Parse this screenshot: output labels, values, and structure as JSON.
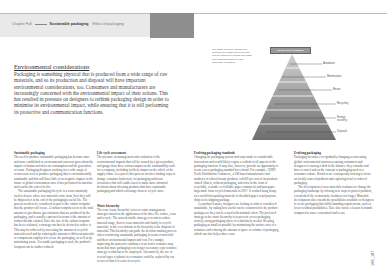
{
  "header": {
    "breadcrumb": [
      "Chapter Full",
      "Sustainable packaging",
      "Ethics of packaging"
    ],
    "current_index": 1
  },
  "intro": {
    "title": "Environmental considerations",
    "body": "Packaging is something physical that is produced from a wide range of raw materials, and so its production and disposal will have important environmental considerations, too. Consumers and manufacturers are increasingly concerned with the environmental impact of their actions. This has resulted in pressure on designers to rethink packaging design in order to minimise its environmental impact, while ensuring that it is still performing its protective and communication functions."
  },
  "figure": {
    "caption": "The waste hierarchy diagram the describes the waste spectrum scale and the options for dealing with waste from most favourable to least favourable packaging.",
    "title": "WASTE MANAGEMENT HIERARCHY",
    "tiers": [
      {
        "label": "Avoidance"
      },
      {
        "label": "Minimisation"
      },
      {
        "label": "Reuse"
      },
      {
        "label": "Recycling"
      },
      {
        "label": "Energy recovery"
      },
      {
        "label": "Disposal"
      }
    ],
    "colors": {
      "top": "#cfcfcf",
      "bottom": "#6e6e6e",
      "divider": "#ffffff"
    }
  },
  "columns": [
    {
      "heading": "Sustainable packaging",
      "paragraphs": [
        "The need to produce sustainable packaging has become more and more established as environmental concerns grow about the impact of human activities on consumption and the generation of waste. Packaging designers working for a wide range of sectors now seek to produce packaging that is environmentally sustainable and that will have little or no negative impact on the future or global environment once it has performed its function and reaches the end of its life.",
        "The sustainable packaging lifecycle is a term commonly used to denote where raw materials come from, how they will be disposed of at the end of the packaging's useful life. The process needs to be considered as part of the carbon footprint that the product will create. A carbon footprint refers to the total amount of greenhouse gas emissions that are produced by the packaging, and is usually expressed in terms of the amount of carbon dioxide emitted. Once the size of the carbon footprint has been evaluated, a strategy can then be devised to reduce it. This may be achieved by increasing the amount of recycled materials used and by reducing the amount of different materials or components employed to create the packaging, as well as by minimising waste. If reusable packaging is used, the product's footprint can be further reduced."
      ]
    },
    {
      "heading": "Life-cycle assessment",
      "paragraphs": [
        "The pressure on management and evaluation of the environmental impacts that will be caused by a given product, and gauges how these actions impact on the sustainability scale for a company, including its likely impact on the whole of the supply chain. As a part of this process involves finding ways to change consumer behaviour, for packaging sufficient inventories that will enable users to make more informed decisions about choosing products that have sustainable packaging and which encourage them to recycle more."
      ],
      "heading2": "Waste hierarchy",
      "paragraphs2": [
        "The term 'waste hierarchy' refers to waste management strategies based on the application of the three Rs: reduce, reuse and recycle. The most desirable strategy is to aim to reduce material usage, then to reuse materials and finally to recycle materials, in the very bottom of the hierarchy is the disposal of materials. This hierarchy can guide the decision-making process when considering sustainable packaging in terms of materials' and their environmental impact and cost. For example, improving the protective attributes of an item's container may mean that more packaging is no longer necessary; a preventative strategy is what has to be employed. Alternatively, the use of several types of plastic in a container could be replaced by one or two so that it is easier to recycle."
      ]
    },
    {
      "heading": "Evolving packaging standards",
      "paragraphs": [
        "Changing the packaging system and ways made to considerable innovations and would likely require a rethink of all aspects of the packaging function. It may also, however, provide an opportunity to create a new packaging standard for a brand. For example, CERN Fresh Distribution Commerce, a UK-based manufacturer and marketer of ethical beauty products, sold 69 per cent of its products 'naked' (that is, without packaging, and often in the form of recyclable, reusable or refillable paper containers) and past paper bags made from recycled materials in 2007. It worked using hemp on a world-first packing material of shredded paper or polystyrene chips in its shipping package.",
        "As product lessons, designers are looking at what is considered sustainable, by asking how useful can be constructed to the product packages so they can be reused with minimal effort. The preferred strategy in the waste hierarchy is to prevent excess packaging entirely, using packaging where it is absolutely needed. Keeping packaging as small as possible by minimising the surface area of a container and reducing the amount of space or volume of packaging, which can also help reduce costs."
      ]
    },
    {
      "heading": "Evolving packaging",
      "paragraphs": [
        "Packaging becomes ever-gradually changing as increasing global environmental awareness among consumers and designers is causing a shift in the balance; they consider and have to travel and on the concept of packaging used as a consumer culture. Retailers are consequently striving to focus on locally sourced products and exploring local or reduced packaging.",
        "The development of new materials continues to change the packaging landscape by offering new ways to protect products, extend shelf life or maximise freshness for longer. Materials development also extends the possibilities available to designers to create packaging that fulfils branding requirements, such as lower residual possibilities. Here also can be a lesson in brands compared to more economical and to use."
      ]
    }
  ],
  "footer": {
    "page_numbers": "186_187"
  }
}
